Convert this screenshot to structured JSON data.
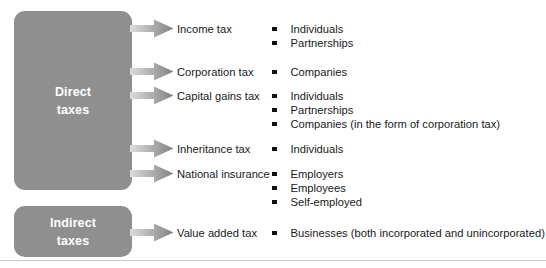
{
  "diagram": {
    "colors": {
      "box_fill": "#8f8f8f",
      "box_text": "#ffffff",
      "arrow_light": "#d8d8d8",
      "arrow_dark": "#8a8a8a",
      "body_text": "#1a1a1a",
      "rule": "#c9c9c9"
    }
  },
  "groups": [
    {
      "id": "direct",
      "line1": "Direct",
      "line2": "taxes"
    },
    {
      "id": "indirect",
      "line1": "Indirect",
      "line2": "taxes"
    }
  ],
  "taxes": [
    {
      "name": "Income tax"
    },
    {
      "name": "Corporation tax"
    },
    {
      "name": "Capital gains tax"
    },
    {
      "name": "Inheritance tax"
    },
    {
      "name": "National insurance"
    },
    {
      "name": "Value added tax"
    }
  ],
  "payers": [
    {
      "text": "Individuals"
    },
    {
      "text": "Partnerships"
    },
    {
      "text": "Companies"
    },
    {
      "text": "Individuals"
    },
    {
      "text": "Partnerships"
    },
    {
      "text": "Companies (in the form of corporation tax)"
    },
    {
      "text": "Individuals"
    },
    {
      "text": "Employers"
    },
    {
      "text": "Employees"
    },
    {
      "text": "Self-employed"
    },
    {
      "text": "Businesses (both incorporated and unincorporated)"
    }
  ]
}
